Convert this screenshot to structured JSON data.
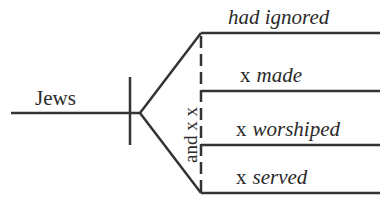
{
  "diagram": {
    "type": "sentence-diagram",
    "subject": "Jews",
    "conjunction_label": "and x x",
    "predicates": [
      {
        "marker": "",
        "verb": "had ignored"
      },
      {
        "marker": "x",
        "verb": "made"
      },
      {
        "marker": "x",
        "verb": "worshiped"
      },
      {
        "marker": "x",
        "verb": "served"
      }
    ],
    "colors": {
      "line": "#333333",
      "text": "#2a2a2a",
      "background": "#ffffff"
    }
  }
}
